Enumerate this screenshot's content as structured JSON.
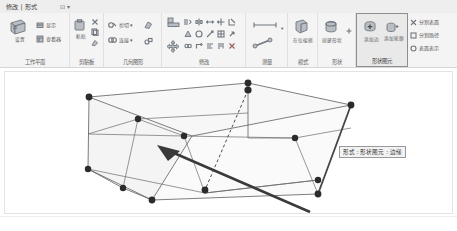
{
  "window": {
    "width": 457,
    "height": 231,
    "background": "#ffffff"
  },
  "ribbon": {
    "context_tab": "修改 | 形式",
    "quick_access": "⊡ ▾",
    "panels": [
      {
        "id": "work-plane",
        "label": "工作平面",
        "buttons": [
          {
            "id": "set",
            "caption": "设置",
            "icon": "workplane-set-icon"
          },
          {
            "id": "show",
            "caption": "显示",
            "icon": "workplane-show-icon"
          },
          {
            "id": "viewer",
            "caption": "查看器",
            "icon": "workplane-viewer-icon"
          }
        ]
      },
      {
        "id": "clipboard",
        "label": "剪贴板",
        "buttons": [
          {
            "id": "paste",
            "caption": "粘贴",
            "icon": "paste-icon"
          },
          {
            "id": "cut",
            "caption": "",
            "icon": "cut-icon"
          },
          {
            "id": "copy",
            "caption": "",
            "icon": "copy-icon"
          },
          {
            "id": "match-type",
            "caption": "",
            "icon": "match-type-icon"
          }
        ]
      },
      {
        "id": "geometry",
        "label": "几何图形",
        "buttons": [
          {
            "id": "cut-geo",
            "caption": "剪切",
            "icon": "cut-geometry-icon"
          },
          {
            "id": "join-geo",
            "caption": "连接",
            "icon": "join-geometry-icon"
          },
          {
            "id": "demolish",
            "caption": "",
            "icon": "demolish-icon"
          },
          {
            "id": "split-face",
            "caption": "",
            "icon": "split-face-icon"
          }
        ]
      },
      {
        "id": "modify",
        "label": "修改",
        "buttons": [
          {
            "id": "align",
            "caption": "",
            "icon": "align-icon"
          },
          {
            "id": "move",
            "caption": "",
            "icon": "move-icon"
          },
          {
            "id": "offset",
            "caption": "",
            "icon": "offset-icon"
          },
          {
            "id": "mirror-axis",
            "caption": "",
            "icon": "mirror-axis-icon"
          },
          {
            "id": "mirror-pick",
            "caption": "",
            "icon": "mirror-pick-icon"
          },
          {
            "id": "rotate",
            "caption": "",
            "icon": "rotate-icon"
          },
          {
            "id": "trim",
            "caption": "",
            "icon": "trim-icon"
          },
          {
            "id": "split",
            "caption": "",
            "icon": "split-icon"
          },
          {
            "id": "array",
            "caption": "",
            "icon": "array-icon"
          },
          {
            "id": "scale",
            "caption": "",
            "icon": "scale-icon"
          },
          {
            "id": "pin",
            "caption": "",
            "icon": "pin-icon"
          },
          {
            "id": "unpin",
            "caption": "",
            "icon": "unpin-icon"
          },
          {
            "id": "copy-move",
            "caption": "",
            "icon": "copy-move-icon"
          },
          {
            "id": "delete",
            "caption": "",
            "icon": "delete-icon"
          }
        ]
      },
      {
        "id": "measure",
        "label": "测量",
        "buttons": [
          {
            "id": "measure-between",
            "caption": "",
            "icon": "measure-between-icon"
          },
          {
            "id": "measure-along",
            "caption": "",
            "icon": "measure-along-icon"
          }
        ]
      },
      {
        "id": "mode",
        "label": "模式",
        "buttons": [
          {
            "id": "edit-in-place",
            "caption": "在位编辑",
            "icon": "edit-in-place-icon"
          }
        ]
      },
      {
        "id": "shape",
        "label": "形状",
        "buttons": [
          {
            "id": "create-form",
            "caption": "创建形状",
            "icon": "create-form-icon"
          },
          {
            "id": "void-form",
            "caption": "",
            "icon": "void-form-icon"
          }
        ]
      },
      {
        "id": "shape-element",
        "label": "形状图元",
        "selected": true,
        "buttons": [
          {
            "id": "dissolve",
            "caption": "融合",
            "icon": "dissolve-icon"
          },
          {
            "id": "add-edge",
            "caption": "添加边",
            "icon": "add-edge-icon"
          },
          {
            "id": "add-profile",
            "caption": "添加轮廓",
            "icon": "add-profile-icon"
          },
          {
            "id": "pick-new",
            "caption": "拾取新",
            "icon": "pick-new-host-icon"
          }
        ]
      },
      {
        "id": "divide",
        "label": "",
        "buttons": [
          {
            "id": "divide-surface",
            "caption": "分割表面",
            "icon": "divide-surface-icon"
          },
          {
            "id": "divide-path",
            "caption": "分割路径",
            "icon": "divide-path-icon"
          },
          {
            "id": "make-pattern",
            "caption": "填充图案",
            "icon": "pattern-icon"
          },
          {
            "id": "surface-rep",
            "caption": "表面表示",
            "icon": "surface-representation-icon"
          }
        ]
      }
    ]
  },
  "canvas": {
    "tooltip": "形式 : 形状图元 : 边缘",
    "geometry": {
      "type": "3d-box-wireframe",
      "edge_color": "#585858",
      "face_fill": "#f6f6f6",
      "vertex_color": "#2b2b2b",
      "highlight_edge_color": "#4c6fa8",
      "pointer_color": "#3a3a3a",
      "vertices": [
        {
          "id": "v-top-back-left",
          "x": 88,
          "y": 96
        },
        {
          "id": "v-top-back-right",
          "x": 247,
          "y": 82
        },
        {
          "id": "v-top-front-right",
          "x": 350,
          "y": 104
        },
        {
          "id": "v-top-mid",
          "x": 217,
          "y": 104
        },
        {
          "id": "v-mid-left",
          "x": 137,
          "y": 118
        },
        {
          "id": "v-mid-center",
          "x": 183,
          "y": 135
        },
        {
          "id": "v-mid-right",
          "x": 294,
          "y": 137
        },
        {
          "id": "v-bot-back-left",
          "x": 87,
          "y": 168
        },
        {
          "id": "v-bot-mid-left",
          "x": 122,
          "y": 187
        },
        {
          "id": "v-bot-front",
          "x": 151,
          "y": 199
        },
        {
          "id": "v-bot-center",
          "x": 204,
          "y": 192
        },
        {
          "id": "v-bot-right",
          "x": 313,
          "y": 179
        },
        {
          "id": "v-bot-front-right",
          "x": 317,
          "y": 193
        }
      ]
    }
  }
}
